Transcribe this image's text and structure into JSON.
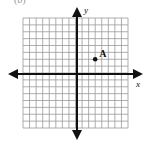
{
  "figure": {
    "part_label": "(b)",
    "x_axis_label": "x",
    "y_axis_label": "y",
    "grid": {
      "x_min": -8,
      "x_max": 8,
      "y_min": -8,
      "y_max": 8,
      "step": 1,
      "line_color": "#9a9a9a",
      "axis_color": "#111111"
    },
    "points": [
      {
        "label": "A",
        "x": 3,
        "y": 2
      }
    ]
  }
}
